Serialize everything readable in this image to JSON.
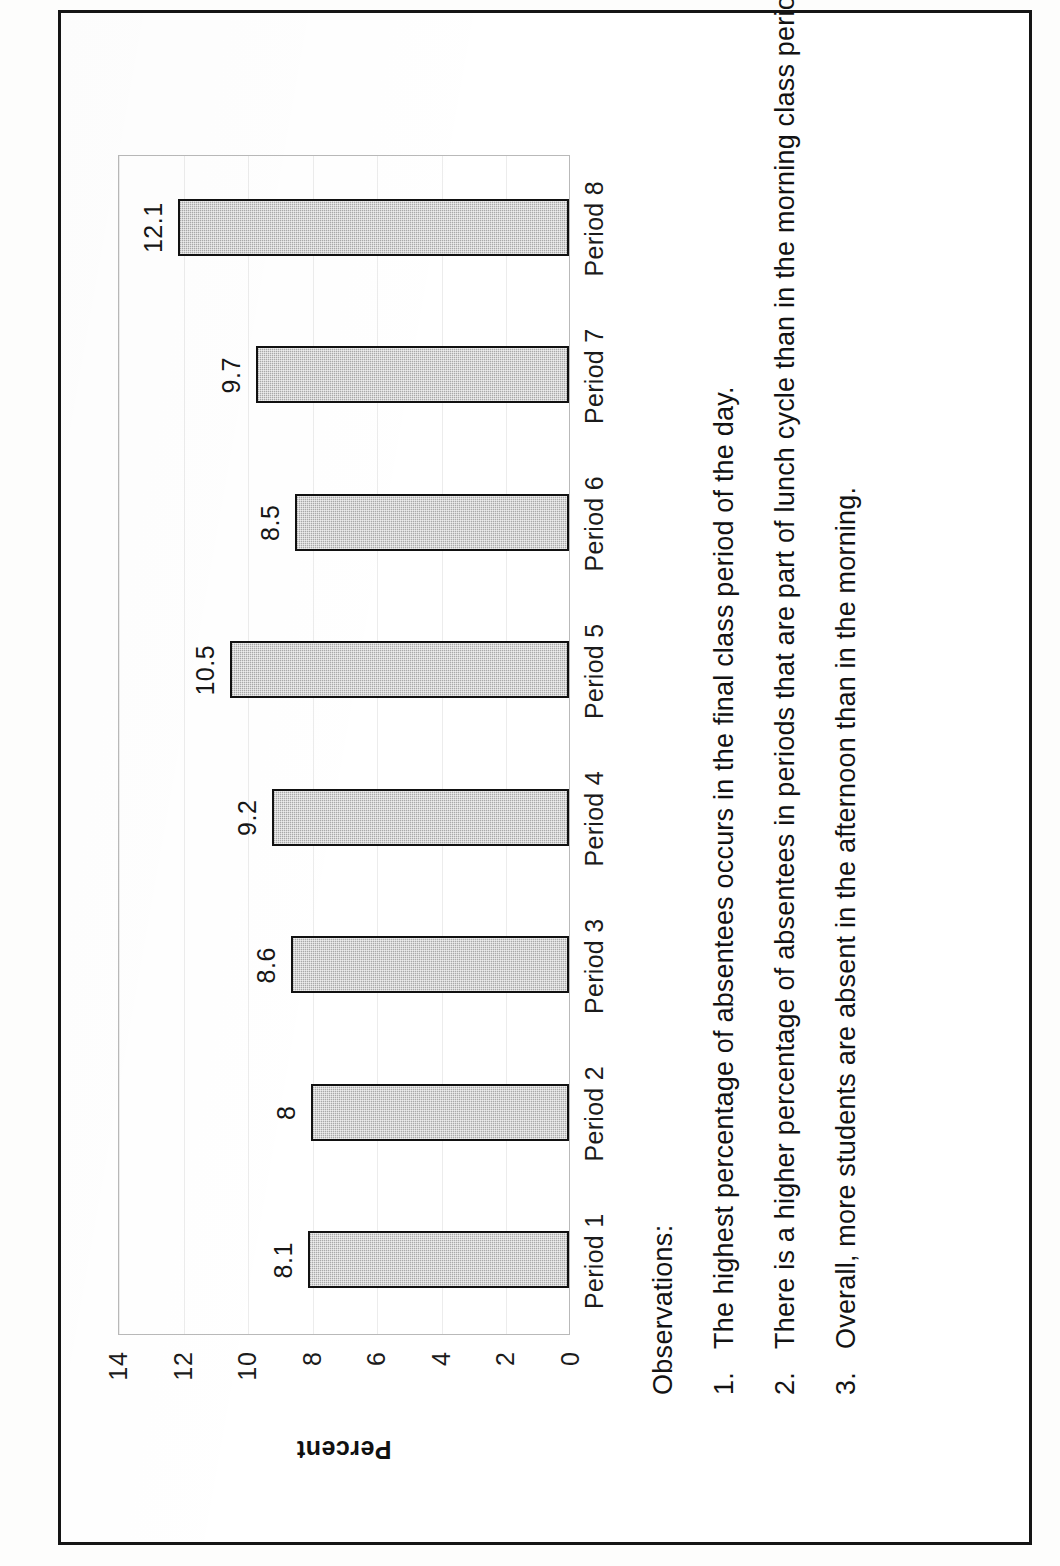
{
  "chart_data": {
    "type": "bar",
    "orientation": "vertical",
    "title": "",
    "xlabel": "",
    "ylabel": "Percent",
    "ylim": [
      0,
      14
    ],
    "ytick_step": 2,
    "yticks": [
      "14",
      "12",
      "10",
      "8",
      "6",
      "4",
      "2",
      "0"
    ],
    "grid": true,
    "legend": "none",
    "categories": [
      "Period 1",
      "Period 2",
      "Period 3",
      "Period 4",
      "Period 5",
      "Period 6",
      "Period 7",
      "Period 8"
    ],
    "values": [
      8.1,
      8,
      8.6,
      9.2,
      10.5,
      8.5,
      9.7,
      12.1
    ],
    "value_labels": [
      "8.1",
      "8",
      "8.6",
      "9.2",
      "10.5",
      "8.5",
      "9.7",
      "12.1"
    ],
    "bar_fill_color": "#a9a9a9",
    "bar_border_color": "#111111"
  },
  "observations": {
    "heading": "Observations:",
    "items": [
      {
        "number": "1.",
        "text": "The highest percentage of absentees occurs in the final class period of the day."
      },
      {
        "number": "2.",
        "text": "There is a higher percentage of absentees in periods that are part of lunch cycle than in the morning class periods."
      },
      {
        "number": "3.",
        "text": "Overall, more students are absent in the afternoon than in the morning."
      }
    ]
  }
}
